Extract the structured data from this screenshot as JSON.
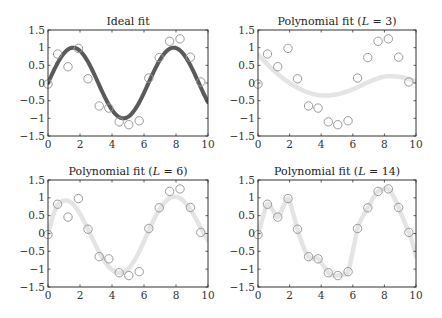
{
  "chart_data": [
    {
      "type": "line",
      "id": "ideal",
      "title": "Ideal fit",
      "title_parts": [
        "Ideal fit"
      ],
      "curve_style": "dark",
      "xlim": [
        0,
        10
      ],
      "ylim": [
        -1.5,
        1.5
      ],
      "xticks": [
        0,
        2,
        4,
        6,
        8,
        10
      ],
      "yticks": [
        1.5,
        1,
        0.5,
        0,
        -0.5,
        -1,
        -1.5
      ],
      "xtick_labels": [
        "0",
        "2",
        "4",
        "6",
        "8",
        "10"
      ],
      "ytick_labels": [
        "1.5",
        "1",
        "0.5",
        "0",
        "−0.5",
        "−1",
        "−1.5"
      ],
      "series": [
        {
          "name": "samples",
          "kind": "scatter",
          "x": [
            0,
            0.6,
            1.25,
            1.9,
            2.5,
            3.2,
            3.8,
            4.45,
            5.05,
            5.7,
            6.3,
            6.95,
            7.6,
            8.25,
            8.9,
            9.55
          ],
          "y": [
            -0.03,
            0.82,
            0.46,
            0.98,
            0.12,
            -0.65,
            -0.71,
            -1.1,
            -1.18,
            -1.07,
            0.14,
            0.72,
            1.18,
            1.25,
            0.73,
            0.03
          ]
        },
        {
          "name": "fit",
          "kind": "line",
          "function": "sin"
        }
      ]
    },
    {
      "type": "line",
      "id": "poly3",
      "title": "Polynomial fit (L = 3)",
      "title_parts": [
        "Polynomial fit (",
        "L",
        " = 3)"
      ],
      "curve_style": "light",
      "xlim": [
        0,
        10
      ],
      "ylim": [
        -1.5,
        1.5
      ],
      "xticks": [
        0,
        2,
        4,
        6,
        8,
        10
      ],
      "yticks": [
        1.5,
        1,
        0.5,
        0,
        -0.5,
        -1,
        -1.5
      ],
      "xtick_labels": [
        "0",
        "2",
        "4",
        "6",
        "8",
        "10"
      ],
      "ytick_labels": [
        "1.5",
        "1",
        "0.5",
        "0",
        "−0.5",
        "−1",
        "−1.5"
      ],
      "series": [
        {
          "name": "samples",
          "kind": "scatter",
          "x": [
            0,
            0.6,
            1.25,
            1.9,
            2.5,
            3.2,
            3.8,
            4.45,
            5.05,
            5.7,
            6.3,
            6.95,
            7.6,
            8.25,
            8.9,
            9.55
          ],
          "y": [
            -0.03,
            0.82,
            0.46,
            0.98,
            0.12,
            -0.65,
            -0.71,
            -1.1,
            -1.18,
            -1.07,
            0.14,
            0.72,
            1.18,
            1.25,
            0.73,
            0.03
          ]
        },
        {
          "name": "fit",
          "kind": "line",
          "x": [
            0,
            1,
            2,
            3,
            4,
            5,
            6,
            7,
            8,
            9,
            10
          ],
          "y": [
            0.8,
            0.35,
            0.0,
            -0.24,
            -0.35,
            -0.32,
            -0.18,
            0.03,
            0.18,
            0.17,
            0.05
          ]
        }
      ]
    },
    {
      "type": "line",
      "id": "poly6",
      "title": "Polynomial fit (L = 6)",
      "title_parts": [
        "Polynomial fit (",
        "L",
        " = 6)"
      ],
      "curve_style": "light",
      "xlim": [
        0,
        10
      ],
      "ylim": [
        -1.5,
        1.5
      ],
      "xticks": [
        0,
        2,
        4,
        6,
        8,
        10
      ],
      "yticks": [
        1.5,
        1,
        0.5,
        0,
        -0.5,
        -1,
        -1.5
      ],
      "xtick_labels": [
        "0",
        "2",
        "4",
        "6",
        "8",
        "10"
      ],
      "ytick_labels": [
        "1.5",
        "1",
        "0.5",
        "0",
        "−0.5",
        "−1",
        "−1.5"
      ],
      "series": [
        {
          "name": "samples",
          "kind": "scatter",
          "x": [
            0,
            0.6,
            1.25,
            1.9,
            2.5,
            3.2,
            3.8,
            4.45,
            5.05,
            5.7,
            6.3,
            6.95,
            7.6,
            8.25,
            8.9,
            9.55
          ],
          "y": [
            -0.03,
            0.82,
            0.46,
            0.98,
            0.12,
            -0.65,
            -0.71,
            -1.1,
            -1.18,
            -1.07,
            0.14,
            0.72,
            1.18,
            1.25,
            0.73,
            0.03
          ]
        },
        {
          "name": "fit",
          "kind": "line",
          "x": [
            0,
            0.5,
            1,
            1.5,
            2,
            2.5,
            3,
            3.5,
            4,
            4.5,
            5,
            5.5,
            6,
            6.5,
            7,
            7.5,
            8,
            8.5,
            9,
            9.5,
            10
          ],
          "y": [
            0.0,
            0.72,
            0.92,
            0.85,
            0.55,
            0.12,
            -0.35,
            -0.75,
            -1.02,
            -1.1,
            -1.0,
            -0.68,
            -0.22,
            0.28,
            0.7,
            0.96,
            1.03,
            0.9,
            0.6,
            0.2,
            -0.2
          ]
        }
      ]
    },
    {
      "type": "line",
      "id": "poly14",
      "title": "Polynomial fit (L = 14)",
      "title_parts": [
        "Polynomial fit (",
        "L",
        " = 14)"
      ],
      "curve_style": "light",
      "xlim": [
        0,
        10
      ],
      "ylim": [
        -1.5,
        1.5
      ],
      "xticks": [
        0,
        2,
        4,
        6,
        8,
        10
      ],
      "yticks": [
        1.5,
        1,
        0.5,
        0,
        -0.5,
        -1,
        -1.5
      ],
      "xtick_labels": [
        "0",
        "2",
        "4",
        "6",
        "8",
        "10"
      ],
      "ytick_labels": [
        "1.5",
        "1",
        "0.5",
        "0",
        "−0.5",
        "−1",
        "−1.5"
      ],
      "series": [
        {
          "name": "samples",
          "kind": "scatter",
          "x": [
            0,
            0.6,
            1.25,
            1.9,
            2.5,
            3.2,
            3.8,
            4.45,
            5.05,
            5.7,
            6.3,
            6.95,
            7.6,
            8.25,
            8.9,
            9.55
          ],
          "y": [
            -0.03,
            0.82,
            0.46,
            0.98,
            0.12,
            -0.65,
            -0.71,
            -1.1,
            -1.18,
            -1.07,
            0.14,
            0.72,
            1.18,
            1.25,
            0.73,
            0.03
          ]
        },
        {
          "name": "fit",
          "kind": "line",
          "x": [
            0,
            0.3,
            0.6,
            0.9,
            1.25,
            1.55,
            1.9,
            2.2,
            2.5,
            2.85,
            3.2,
            3.5,
            3.8,
            4.1,
            4.45,
            4.75,
            5.05,
            5.4,
            5.7,
            6.0,
            6.3,
            6.6,
            6.95,
            7.3,
            7.6,
            7.9,
            8.25,
            8.6,
            8.9,
            9.2,
            9.55,
            9.8,
            10
          ],
          "y": [
            -0.03,
            0.45,
            0.82,
            0.68,
            0.46,
            0.7,
            0.98,
            0.6,
            0.12,
            -0.35,
            -0.65,
            -0.7,
            -0.71,
            -0.88,
            -1.1,
            -1.17,
            -1.18,
            -1.15,
            -1.07,
            -0.5,
            0.14,
            0.45,
            0.72,
            1.0,
            1.18,
            1.24,
            1.25,
            1.02,
            0.73,
            0.4,
            0.03,
            -0.3,
            -0.65
          ]
        }
      ]
    }
  ]
}
